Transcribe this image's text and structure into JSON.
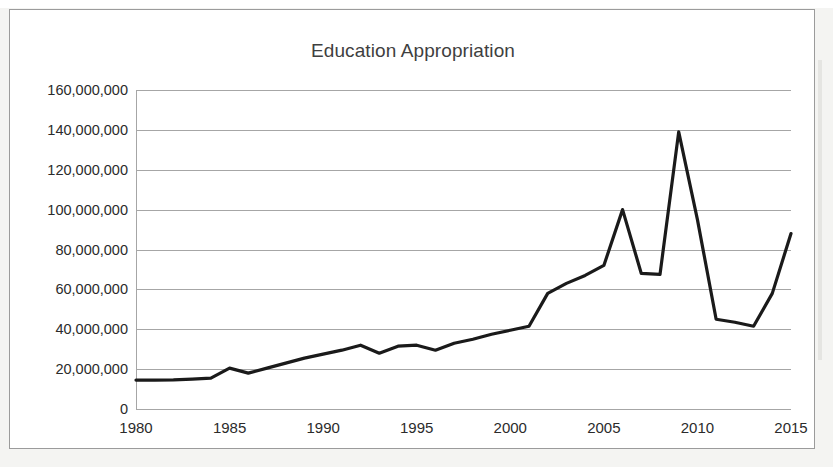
{
  "chart_data": {
    "type": "line",
    "title": "Education Appropriation",
    "xlabel": "",
    "ylabel": "",
    "xlim": [
      1980,
      2015
    ],
    "ylim": [
      0,
      160000000
    ],
    "grid": true,
    "legend": false,
    "legend_position": "none",
    "y_ticks": [
      0,
      20000000,
      40000000,
      60000000,
      80000000,
      100000000,
      120000000,
      140000000,
      160000000
    ],
    "y_tick_labels": [
      "0",
      "20,000,000",
      "40,000,000",
      "60,000,000",
      "80,000,000",
      "100,000,000",
      "120,000,000",
      "140,000,000",
      "160,000,000"
    ],
    "x_ticks": [
      1980,
      1985,
      1990,
      1995,
      2000,
      2005,
      2010,
      2015
    ],
    "x_tick_labels": [
      "1980",
      "1985",
      "1990",
      "1995",
      "2000",
      "2005",
      "2010",
      "2015"
    ],
    "x": [
      1980,
      1981,
      1982,
      1983,
      1984,
      1985,
      1986,
      1987,
      1988,
      1989,
      1990,
      1991,
      1992,
      1993,
      1994,
      1995,
      1996,
      1997,
      1998,
      1999,
      2000,
      2001,
      2002,
      2003,
      2004,
      2005,
      2006,
      2007,
      2008,
      2009,
      2010,
      2011,
      2012,
      2013,
      2014,
      2015
    ],
    "values": [
      14500000,
      14500000,
      14600000,
      15000000,
      15500000,
      20500000,
      18000000,
      20500000,
      23000000,
      25500000,
      27500000,
      29500000,
      32000000,
      28000000,
      31500000,
      32000000,
      29500000,
      33000000,
      35000000,
      37500000,
      39500000,
      41500000,
      58000000,
      63000000,
      67000000,
      72000000,
      100000000,
      68000000,
      67500000,
      139000000,
      95000000,
      45000000,
      43500000,
      41500000,
      58000000,
      88000000
    ],
    "series": [
      {
        "name": "Education Appropriation",
        "color": "#1a1a1a",
        "line_width": 3.2,
        "values": [
          14500000,
          14500000,
          14600000,
          15000000,
          15500000,
          20500000,
          18000000,
          20500000,
          23000000,
          25500000,
          27500000,
          29500000,
          32000000,
          28000000,
          31500000,
          32000000,
          29500000,
          33000000,
          35000000,
          37500000,
          39500000,
          41500000,
          58000000,
          63000000,
          67000000,
          72000000,
          100000000,
          68000000,
          67500000,
          139000000,
          95000000,
          45000000,
          43500000,
          41500000,
          58000000,
          88000000
        ]
      }
    ],
    "annotations": [],
    "colors": {
      "line": "#1a1a1a",
      "gridline": "#a6a6a6",
      "title_text": "#3f3f3f",
      "tick_text": "#2b2b2b",
      "plot_background": "#ffffff",
      "frame_border": "#9b9b9b",
      "page_background": "#f4f4f2"
    }
  }
}
